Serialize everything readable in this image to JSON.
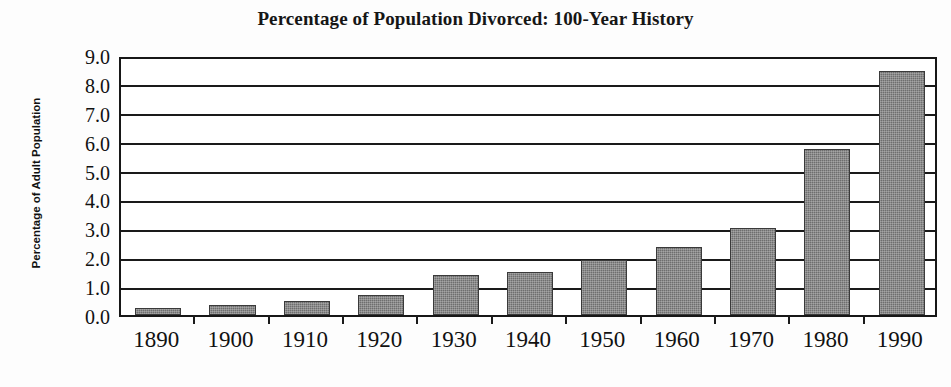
{
  "chart_data": {
    "type": "bar",
    "title": "Percentage of Population Divorced: 100-Year History",
    "xlabel": "",
    "ylabel": "Percentage of Adult Population",
    "categories": [
      "1890",
      "1900",
      "1910",
      "1920",
      "1930",
      "1940",
      "1950",
      "1960",
      "1970",
      "1980",
      "1990"
    ],
    "values": [
      0.25,
      0.35,
      0.5,
      0.7,
      1.4,
      1.5,
      1.9,
      2.35,
      3.0,
      5.75,
      8.45
    ],
    "ylim": [
      0.0,
      9.0
    ],
    "ytick_labels": [
      "9.0",
      "8.0",
      "7.0",
      "6.0",
      "5.0",
      "4.0",
      "3.0",
      "2.0",
      "1.0",
      "0.0"
    ],
    "ytick_values": [
      9.0,
      8.0,
      7.0,
      6.0,
      5.0,
      4.0,
      3.0,
      2.0,
      1.0,
      0.0
    ],
    "grid": true,
    "grid_axis": "y",
    "legend": false,
    "legend_position": "none",
    "bar_color": "#6e6e6e",
    "axis_color": "#1a1a1a",
    "background_color": "#ffffff"
  },
  "figure": {
    "title_text": "Percentage of Population Divorced: 100-Year History",
    "y_axis_title": "Percentage of Adult Population"
  }
}
